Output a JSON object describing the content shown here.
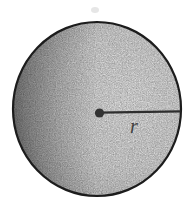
{
  "figure": {
    "radius_label": "r",
    "colors": {
      "background": "#ffffff",
      "outline": "#1c1c1c",
      "interior_light": "#e3e3e3",
      "interior_dark": "#7e7e7e",
      "radius_line": "#2e2e2e",
      "center_dot": "#333333",
      "label": "#414141"
    }
  }
}
